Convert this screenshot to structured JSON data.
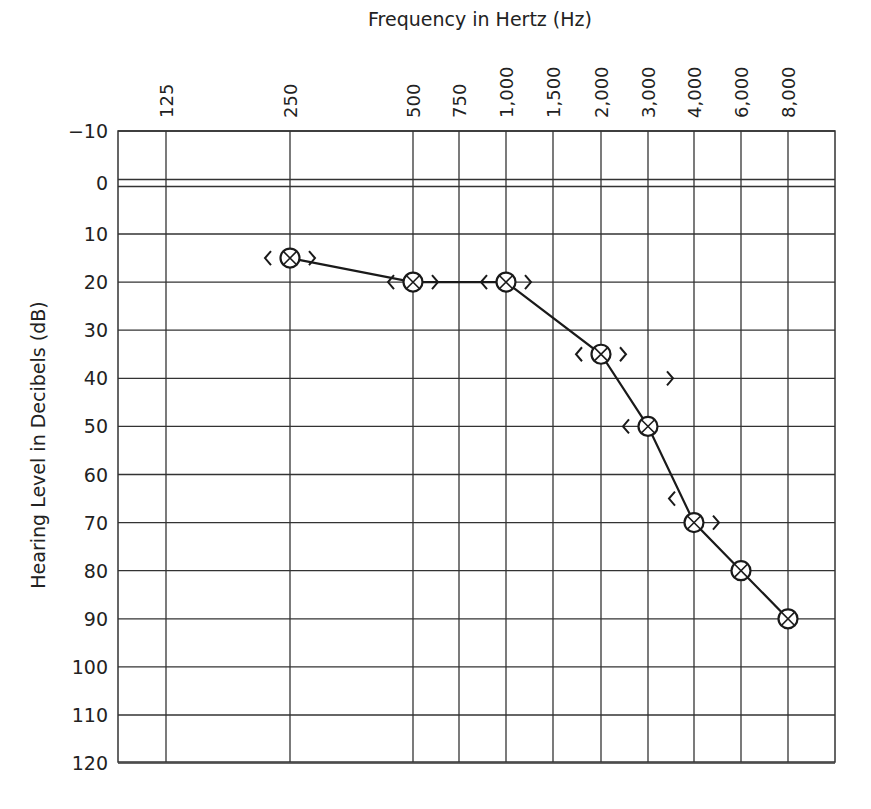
{
  "chart_data": {
    "type": "line",
    "title": "Frequency in Hertz (Hz)",
    "xlabel": "Frequency in Hertz (Hz)",
    "ylabel": "Hearing Level in Decibels (dB)",
    "x_tick_labels": [
      "125",
      "250",
      "500",
      "750",
      "1,000",
      "1,500",
      "2,000",
      "3,000",
      "4,000",
      "6,000",
      "8,000"
    ],
    "x_values_hz": [
      125,
      250,
      500,
      750,
      1000,
      1500,
      2000,
      3000,
      4000,
      6000,
      8000
    ],
    "y_tick_labels": [
      "−10",
      "0",
      "10",
      "20",
      "30",
      "40",
      "50",
      "60",
      "70",
      "80",
      "90",
      "100",
      "110",
      "120"
    ],
    "ylim": [
      -10,
      120
    ],
    "y_inverted": true,
    "grid": true,
    "legend": null,
    "series": [
      {
        "name": "Air conduction (masked, both ears ⊗)",
        "marker": "circle-x",
        "x": [
          250,
          500,
          1000,
          2000,
          3000,
          4000,
          6000,
          8000
        ],
        "values": [
          15,
          20,
          20,
          35,
          50,
          70,
          80,
          90
        ]
      }
    ],
    "bone_conduction": {
      "left_marker": "<",
      "right_marker": ">",
      "points": [
        {
          "hz": 250,
          "left": 15,
          "right": 15
        },
        {
          "hz": 500,
          "left": 20,
          "right": 20
        },
        {
          "hz": 1000,
          "left": 20,
          "right": 20
        },
        {
          "hz": 2000,
          "left": 35,
          "right": 35
        },
        {
          "hz": 3000,
          "left": 50,
          "right": 40
        },
        {
          "hz": 4000,
          "left": 65,
          "right": 70
        }
      ]
    }
  },
  "layout": {
    "plot_left": 118,
    "plot_right": 835,
    "plot_top": 131,
    "plot_bottom": 762,
    "x_positions": [
      166,
      290,
      413,
      459,
      506,
      553,
      601,
      648,
      694,
      741,
      788
    ],
    "y_zero_px": 183,
    "px_per_10db": 48.1,
    "line_color": "#1a1a1a",
    "grid_color": "#333333"
  }
}
